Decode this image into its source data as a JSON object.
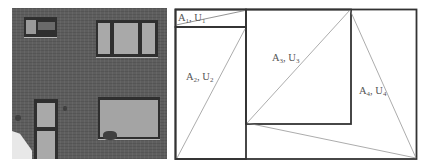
{
  "photo": {
    "description": "grayscale brick house facade",
    "colors": {
      "wall": "#5e5e5e",
      "frame": "#2f2f2f",
      "glass": "#a9a9a9"
    }
  },
  "diagram": {
    "stroke_color": "#333333",
    "thin_stroke_color": "#777777",
    "regions": [
      {
        "id": "1",
        "label": "A",
        "sub": "1",
        "sep": ", ",
        "label2": "U",
        "sub2": "1"
      },
      {
        "id": "2",
        "label": "A",
        "sub": "2",
        "sep": ", ",
        "label2": "U",
        "sub2": "2"
      },
      {
        "id": "3",
        "label": "A",
        "sub": "3",
        "sep": ", ",
        "label2": "U",
        "sub2": "3"
      },
      {
        "id": "4",
        "label": "A",
        "sub": "4",
        "sep": ", ",
        "label2": "U",
        "sub2": "4"
      }
    ]
  }
}
